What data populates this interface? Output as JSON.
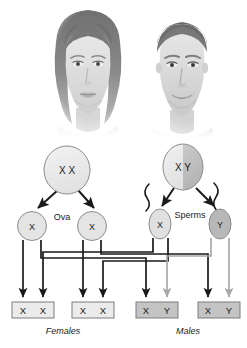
{
  "figure": {
    "photos": [
      {
        "id": "female-parent-photo",
        "alt_label": "Female parent portrait"
      },
      {
        "id": "male-parent-photo",
        "alt_label": "Male parent portrait"
      }
    ]
  },
  "parents": [
    {
      "id": "female-parent",
      "genotype": "X X",
      "alleles": [
        "X",
        "X"
      ],
      "shape": "oval",
      "fill": "#e8e8e8",
      "half_fill": "#e8e8e8"
    },
    {
      "id": "male-parent",
      "genotype": "X Y",
      "alleles": [
        "X",
        "Y"
      ],
      "shape": "oval",
      "fill": "#e8e8e8",
      "half_fill": "#bdbdbd"
    }
  ],
  "gamete_labels": {
    "ova": "Ova",
    "sperms": "Sperms"
  },
  "gametes": [
    {
      "id": "ovum-1",
      "allele": "X",
      "type": "ovum",
      "fill": "#e0e0e0"
    },
    {
      "id": "ovum-2",
      "allele": "X",
      "type": "ovum",
      "fill": "#e0e0e0"
    },
    {
      "id": "sperm-x",
      "allele": "X",
      "type": "sperm",
      "fill": "#e0e0e0"
    },
    {
      "id": "sperm-y",
      "allele": "Y",
      "type": "sperm",
      "fill": "#b8b8b8"
    }
  ],
  "offspring": [
    {
      "id": "offspring-1",
      "genotype": "X X",
      "alleles": [
        "X",
        "X"
      ],
      "sex": "Female",
      "fill": "#ebebeb"
    },
    {
      "id": "offspring-2",
      "genotype": "X X",
      "alleles": [
        "X",
        "X"
      ],
      "sex": "Female",
      "fill": "#ebebeb"
    },
    {
      "id": "offspring-3",
      "genotype": "X Y",
      "alleles": [
        "X",
        "Y"
      ],
      "sex": "Male",
      "fill": "#c4c4c4"
    },
    {
      "id": "offspring-4",
      "genotype": "X Y",
      "alleles": [
        "X",
        "Y"
      ],
      "sex": "Male",
      "fill": "#c4c4c4"
    }
  ],
  "captions": {
    "females": "Females",
    "males": "Males"
  },
  "colors": {
    "line_dark": "#1a1a1a",
    "line_light": "#a8a8a8",
    "outline": "#8c8c8c",
    "background": "#ffffff"
  }
}
